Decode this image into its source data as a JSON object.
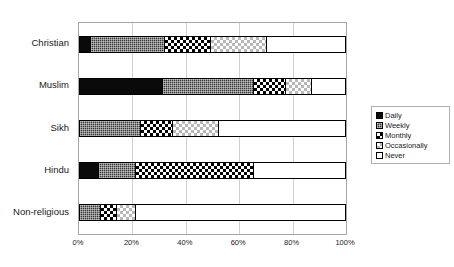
{
  "chart_data": {
    "type": "bar",
    "orientation": "horizontal",
    "stacked": true,
    "normalized": true,
    "title": "",
    "xlabel": "",
    "ylabel": "",
    "xlim": [
      0,
      100
    ],
    "xticks": [
      "0%",
      "20%",
      "40%",
      "60%",
      "80%",
      "100%"
    ],
    "xtick_values": [
      0,
      20,
      40,
      60,
      80,
      100
    ],
    "grid": true,
    "legend_position": "right",
    "categories": [
      "Christian",
      "Muslim",
      "Sikh",
      "Hindu",
      "Non-religious"
    ],
    "series": [
      {
        "name": "Daily",
        "pattern": "solid-black",
        "values": [
          4,
          31,
          0,
          7,
          0
        ]
      },
      {
        "name": "Weekly",
        "pattern": "dense-dark-grid",
        "values": [
          28,
          34,
          23,
          14,
          8
        ]
      },
      {
        "name": "Monthly",
        "pattern": "checkerboard",
        "values": [
          17,
          12,
          12,
          44,
          6
        ]
      },
      {
        "name": "Occasionally",
        "pattern": "light-dotted",
        "values": [
          21,
          10,
          17,
          0,
          7
        ]
      },
      {
        "name": "Never",
        "pattern": "white-empty",
        "values": [
          30,
          13,
          48,
          35,
          79
        ]
      }
    ]
  },
  "legend": {
    "items": [
      {
        "label": "Daily"
      },
      {
        "label": "Weekly"
      },
      {
        "label": "Monthly"
      },
      {
        "label": "Occasionally"
      },
      {
        "label": "Never"
      }
    ]
  },
  "top_strip": {
    "text": ""
  }
}
